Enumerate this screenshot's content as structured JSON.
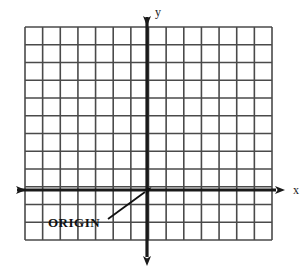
{
  "figure": {
    "kind": "cartesian-coordinate-grid",
    "width": 307,
    "height": 275,
    "background_color": "#ffffff",
    "grid": {
      "columns": 14,
      "rows": 12,
      "left": 25,
      "top": 27,
      "right": 272,
      "bottom": 240,
      "cell_width": 17.64,
      "cell_height": 17.75,
      "line_color": "#4a4a4a",
      "line_width": 1.6
    },
    "axes": {
      "color": "#1a1a1a",
      "line_width": 3.2,
      "origin_x": 147,
      "origin_y": 190,
      "x_axis": {
        "label": "x",
        "left_end": 8,
        "right_end": 285,
        "y": 190,
        "arrow_left": true,
        "arrow_right": true
      },
      "y_axis": {
        "label": "y",
        "top_end": 8,
        "bottom_end": 266,
        "x": 147,
        "arrow_top": true,
        "arrow_bottom": true
      }
    },
    "annotation": {
      "text": "ORIGIN",
      "text_x": 48,
      "text_y": 216,
      "pointer": {
        "from_x": 108,
        "from_y": 219,
        "to_x": 145,
        "to_y": 192,
        "color": "#111111",
        "line_width": 1.8
      }
    }
  }
}
